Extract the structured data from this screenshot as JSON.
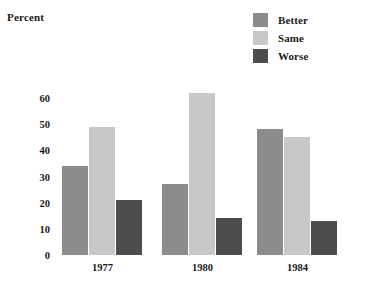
{
  "chart_data": {
    "type": "bar",
    "title": "",
    "ylabel": "Percent",
    "xlabel": "",
    "categories": [
      "1977",
      "1980",
      "1984"
    ],
    "series": [
      {
        "name": "Better",
        "color": "#8c8c8c",
        "values": [
          34,
          27,
          48
        ]
      },
      {
        "name": "Same",
        "color": "#c8c8c8",
        "values": [
          49,
          62,
          45
        ]
      },
      {
        "name": "Worse",
        "color": "#4d4d4d",
        "values": [
          21,
          14,
          13
        ]
      }
    ],
    "ylim": [
      0,
      65
    ],
    "yticks": [
      0,
      10,
      20,
      30,
      40,
      50,
      60
    ],
    "ytick_labels": [
      "0",
      "10",
      "20",
      "30",
      "40",
      "50",
      "60"
    ],
    "grid": false,
    "legend_position": "top-right"
  },
  "axis": {
    "y_title": "Percent",
    "ytick_0": "0",
    "ytick_10": "10",
    "ytick_20": "20",
    "ytick_30": "30",
    "ytick_40": "40",
    "ytick_50": "50",
    "ytick_60": "60"
  },
  "legend": {
    "items": [
      {
        "label": "Better",
        "color": "#8c8c8c"
      },
      {
        "label": "Same",
        "color": "#c8c8c8"
      },
      {
        "label": "Worse",
        "color": "#4d4d4d"
      }
    ]
  },
  "xaxis": {
    "labels": [
      "1977",
      "1980",
      "1984"
    ]
  }
}
